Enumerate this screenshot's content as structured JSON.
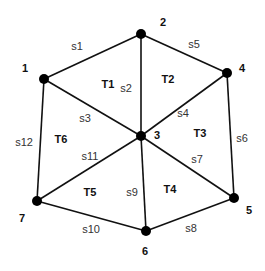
{
  "diagram": {
    "nodes": [
      {
        "id": "1",
        "label": "1",
        "x": 44,
        "y": 79,
        "lx": 25,
        "ly": 72
      },
      {
        "id": "2",
        "label": "2",
        "x": 141,
        "y": 34,
        "lx": 163,
        "ly": 26
      },
      {
        "id": "3",
        "label": "3",
        "x": 141,
        "y": 136,
        "lx": 157,
        "ly": 139
      },
      {
        "id": "4",
        "label": "4",
        "x": 227,
        "y": 73,
        "lx": 242,
        "ly": 72
      },
      {
        "id": "5",
        "label": "5",
        "x": 234,
        "y": 198,
        "lx": 249,
        "ly": 214
      },
      {
        "id": "6",
        "label": "6",
        "x": 146,
        "y": 231,
        "lx": 145,
        "ly": 255
      },
      {
        "id": "7",
        "label": "7",
        "x": 37,
        "y": 201,
        "lx": 22,
        "ly": 222
      }
    ],
    "edges": [
      {
        "label": "s1",
        "from": "1",
        "to": "2",
        "lx": 77,
        "ly": 50
      },
      {
        "label": "s2",
        "from": "2",
        "to": "3",
        "lx": 126,
        "ly": 92
      },
      {
        "label": "s3",
        "from": "1",
        "to": "3",
        "lx": 85,
        "ly": 122
      },
      {
        "label": "s4",
        "from": "3",
        "to": "4",
        "lx": 183,
        "ly": 117
      },
      {
        "label": "s5",
        "from": "2",
        "to": "4",
        "lx": 194,
        "ly": 48
      },
      {
        "label": "s6",
        "from": "4",
        "to": "5",
        "lx": 242,
        "ly": 142
      },
      {
        "label": "s7",
        "from": "3",
        "to": "5",
        "lx": 197,
        "ly": 163
      },
      {
        "label": "s8",
        "from": "5",
        "to": "6",
        "lx": 191,
        "ly": 232
      },
      {
        "label": "s9",
        "from": "3",
        "to": "6",
        "lx": 132,
        "ly": 196
      },
      {
        "label": "s10",
        "from": "6",
        "to": "7",
        "lx": 91,
        "ly": 233
      },
      {
        "label": "s11",
        "from": "3",
        "to": "7",
        "lx": 90,
        "ly": 160
      },
      {
        "label": "s12",
        "from": "1",
        "to": "7",
        "lx": 24,
        "ly": 146
      }
    ],
    "triangles": [
      {
        "label": "T1",
        "lx": 108,
        "ly": 88
      },
      {
        "label": "T2",
        "lx": 168,
        "ly": 83
      },
      {
        "label": "T3",
        "lx": 200,
        "ly": 137
      },
      {
        "label": "T4",
        "lx": 170,
        "ly": 193
      },
      {
        "label": "T5",
        "lx": 90,
        "ly": 196
      },
      {
        "label": "T6",
        "lx": 61,
        "ly": 143
      }
    ]
  }
}
